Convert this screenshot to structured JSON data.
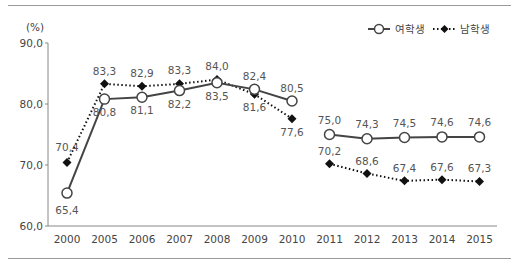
{
  "chart_data": {
    "type": "line",
    "title": "",
    "ylabel": "(%)",
    "xlabel": "",
    "ylim": [
      60.0,
      90.0
    ],
    "yticks": [
      "60,0",
      "70,0",
      "80,0",
      "90,0"
    ],
    "grid": false,
    "legend_position": "top-right",
    "categories": [
      "2000",
      "2005",
      "2006",
      "2007",
      "2008",
      "2009",
      "2010",
      "2011",
      "2012",
      "2013",
      "2014",
      "2015"
    ],
    "series": [
      {
        "name": "여학생",
        "style": "solid line, open circle markers",
        "values": [
          65.4,
          80.8,
          81.1,
          82.2,
          83.5,
          82.4,
          80.5,
          75.0,
          74.3,
          74.5,
          74.6,
          74.6
        ],
        "labels": [
          "65,4",
          "80,8",
          "81,1",
          "82,2",
          "83,5",
          "82,4",
          "80,5",
          "75,0",
          "74,3",
          "74,5",
          "74,6",
          "74,6"
        ]
      },
      {
        "name": "남학생",
        "style": "dotted line, filled diamond markers",
        "values": [
          70.4,
          83.3,
          82.9,
          83.3,
          84.0,
          81.6,
          77.6,
          70.2,
          68.6,
          67.4,
          67.6,
          67.3
        ],
        "labels": [
          "70,4",
          "83,3",
          "82,9",
          "83,3",
          "84,0",
          "81,6",
          "77,6",
          "70,2",
          "68,6",
          "67,4",
          "67,6",
          "67,3"
        ]
      }
    ],
    "breaks": [
      "line discontinuity between 2010 and 2011"
    ]
  },
  "legend": {
    "female": "여학생",
    "male": "남학생"
  },
  "axis": {
    "unit": "(%)"
  }
}
